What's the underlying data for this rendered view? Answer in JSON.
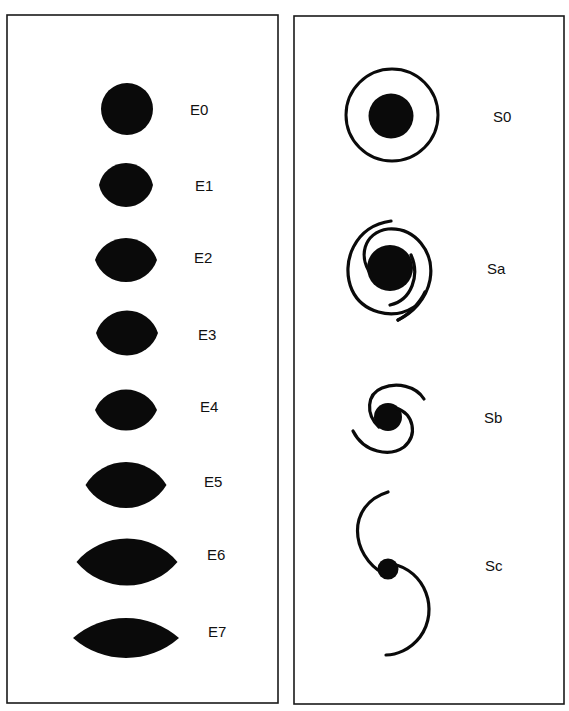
{
  "figure": {
    "colors": {
      "ink": "#0a0a0a",
      "frame": "#1a1a1a",
      "background": "#ffffff"
    },
    "panels": [
      {
        "id": "elliptical",
        "x": 7,
        "y": 15,
        "w": 271,
        "h": 688
      },
      {
        "id": "spiral",
        "x": 294,
        "y": 16,
        "w": 270,
        "h": 688
      }
    ]
  },
  "elliptical": {
    "items": [
      {
        "label": "E0",
        "cx": 127,
        "cy": 109,
        "w": 52,
        "h": 52,
        "label_x": 190,
        "label_y": 111
      },
      {
        "label": "E1",
        "cx": 126,
        "cy": 185,
        "w": 54,
        "h": 44,
        "label_x": 195,
        "label_y": 187
      },
      {
        "label": "E2",
        "cx": 126,
        "cy": 260,
        "w": 62,
        "h": 44,
        "label_x": 194,
        "label_y": 259
      },
      {
        "label": "E3",
        "cx": 127,
        "cy": 333,
        "w": 62,
        "h": 45,
        "label_x": 198,
        "label_y": 336
      },
      {
        "label": "E4",
        "cx": 126,
        "cy": 410,
        "w": 62,
        "h": 41,
        "label_x": 200,
        "label_y": 408
      },
      {
        "label": "E5",
        "cx": 126,
        "cy": 485,
        "w": 81,
        "h": 46,
        "label_x": 204,
        "label_y": 483
      },
      {
        "label": "E6",
        "cx": 127,
        "cy": 562,
        "w": 101,
        "h": 47,
        "label_x": 207,
        "label_y": 556
      },
      {
        "label": "E7",
        "cx": 126,
        "cy": 638,
        "w": 106,
        "h": 40,
        "label_x": 208,
        "label_y": 633
      }
    ]
  },
  "spiral": {
    "items": [
      {
        "label": "S0",
        "label_x": 493,
        "label_y": 118
      },
      {
        "label": "Sa",
        "label_x": 487,
        "label_y": 270
      },
      {
        "label": "Sb",
        "label_x": 484,
        "label_y": 419
      },
      {
        "label": "Sc",
        "label_x": 485,
        "label_y": 567
      }
    ]
  }
}
